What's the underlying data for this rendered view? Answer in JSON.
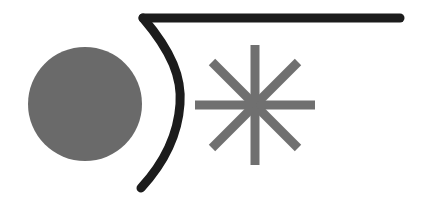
{
  "canvas": {
    "width": 422,
    "height": 207,
    "background_color": "#ffffff",
    "title": "Abstract Shapes Figure"
  },
  "palette": {
    "gray_fill": "#6a6a6a",
    "gray_stroke": "#707070",
    "ink_black": "#1c1c1c",
    "background": "#ffffff"
  },
  "shapes": [
    {
      "id": "gray-disc",
      "kind": "circle",
      "label": "Filled gray disc",
      "cx": 85,
      "cy": 104,
      "r": 57,
      "fill": "#6a6a6a",
      "stroke": "none",
      "stroke_width": 0
    },
    {
      "id": "radical-curve",
      "kind": "path",
      "label": "Dark curved hook with horizontal bar",
      "d": "M 143 18 C 172 52 182 78 180 104 C 178 134 164 163 141 188",
      "fill": "none",
      "stroke": "#1c1c1c",
      "stroke_width": 9,
      "stroke_linecap": "round"
    },
    {
      "id": "top-bar",
      "kind": "line",
      "label": "Horizontal top bar",
      "x1": 143,
      "y1": 18,
      "x2": 400,
      "y2": 18,
      "stroke": "#1c1c1c",
      "stroke_width": 9,
      "stroke_linecap": "round"
    },
    {
      "id": "asterisk-star",
      "kind": "asterisk",
      "label": "Eight-pointed gray asterisk",
      "cx": 255,
      "cy": 105,
      "arm_length": 60,
      "arm_count": 8,
      "stroke": "#707070",
      "stroke_width": 9,
      "arms": [
        {
          "name": "arm-north",
          "angle_deg": 270,
          "x1": 255,
          "y1": 105,
          "x2": 255,
          "y2": 45
        },
        {
          "name": "arm-northeast",
          "angle_deg": 315,
          "x1": 255,
          "y1": 105,
          "x2": 298,
          "y2": 62
        },
        {
          "name": "arm-east",
          "angle_deg": 0,
          "x1": 255,
          "y1": 105,
          "x2": 315,
          "y2": 105
        },
        {
          "name": "arm-southeast",
          "angle_deg": 45,
          "x1": 255,
          "y1": 105,
          "x2": 298,
          "y2": 148
        },
        {
          "name": "arm-south",
          "angle_deg": 90,
          "x1": 255,
          "y1": 105,
          "x2": 255,
          "y2": 165
        },
        {
          "name": "arm-southwest",
          "angle_deg": 135,
          "x1": 255,
          "y1": 105,
          "x2": 212,
          "y2": 148
        },
        {
          "name": "arm-west",
          "angle_deg": 180,
          "x1": 255,
          "y1": 105,
          "x2": 195,
          "y2": 105
        },
        {
          "name": "arm-northwest",
          "angle_deg": 225,
          "x1": 255,
          "y1": 105,
          "x2": 212,
          "y2": 62
        }
      ]
    }
  ]
}
